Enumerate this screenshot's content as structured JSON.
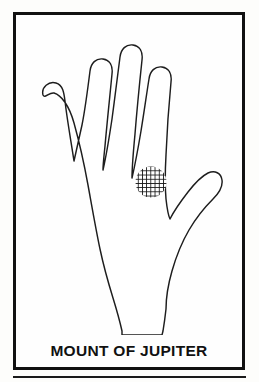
{
  "figure": {
    "caption": "MOUNT OF JUPITER",
    "view": "back of left hand, fingers up",
    "marker": {
      "name": "mount-of-jupiter-marker",
      "style": "cross-hatch",
      "shape": "circle",
      "center_x": 148,
      "center_y": 179,
      "radius": 15,
      "color": "#141414"
    },
    "colors": {
      "ink": "#111111",
      "outline": "#1d1d1d",
      "paper": "#fefefe",
      "page": "#fdfdfb",
      "separator": "#1a1a1a"
    },
    "border": {
      "width_px": 3,
      "color": "#111111"
    },
    "hand": {
      "fingers": [
        "pinky",
        "ring",
        "middle",
        "index",
        "thumb"
      ],
      "outline_stroke_px": 1.4
    }
  }
}
